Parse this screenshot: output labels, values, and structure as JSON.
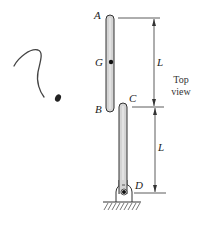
{
  "diagram": {
    "type": "mechanism-top-view",
    "view_label_line1": "Top",
    "view_label_line2": "view",
    "points": {
      "A": "A",
      "B": "B",
      "C": "C",
      "D": "D",
      "G": "G"
    },
    "dimensions": {
      "upper": "L",
      "lower": "L"
    },
    "members": [
      {
        "name": "bar AB",
        "from": "A",
        "to": "B",
        "center_mark": "G"
      },
      {
        "name": "bar CD",
        "from": "C",
        "to": "D",
        "pinned_at": "D"
      }
    ],
    "support": "pin support at D with fixed ground hatch",
    "annotation": "hand-drawn question mark at left"
  },
  "colors": {
    "ink": "#222222",
    "bar_fill": "#d4d4d4",
    "bar_stroke": "#333333",
    "background": "#ffffff"
  }
}
